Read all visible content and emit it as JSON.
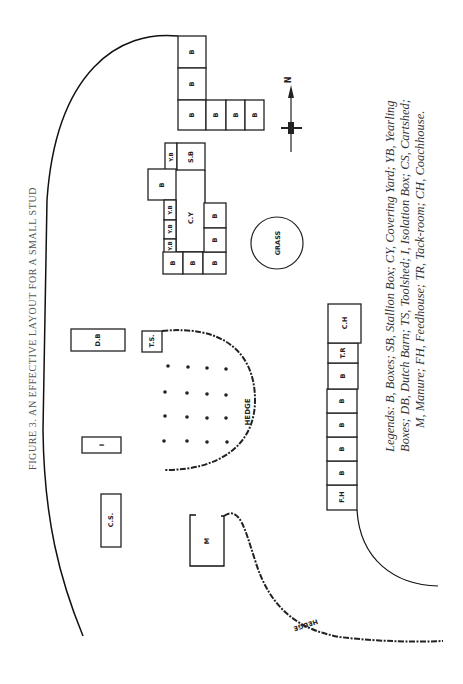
{
  "figure": {
    "title": "FIGURE 3. AN EFFECTIVE LAYOUT FOR A SMALL STUD",
    "legend_line1": "Legends: B, Boxes; SB, Stallion Box; CY, Covering Yard; YB, Yearling",
    "legend_line2": "Boxes; DB, Dutch Barn; TS, Toolshed; I, Isolation Box; CS, Cartshed;",
    "legend_line3": "M, Manure; FH, Feedhouse; TR, Tack-room; CH, Coachhouse."
  },
  "compass": {
    "label": "N"
  },
  "labels": {
    "box": "B",
    "stallion_box": "S.B",
    "yearling_box": "Y.B",
    "covering_yard": "C.Y",
    "grass": "GRASS",
    "dutch_barn": "D.B",
    "toolshed": "T.S.",
    "isolation": "I",
    "cartshed": "C.S.",
    "manure": "M",
    "feedhouse": "F.H",
    "tack_room": "T.R",
    "coachhouse": "C.H",
    "hedge": "HEDGE"
  },
  "legend": [
    {
      "code": "B",
      "meaning": "Boxes"
    },
    {
      "code": "SB",
      "meaning": "Stallion Box"
    },
    {
      "code": "CY",
      "meaning": "Covering Yard"
    },
    {
      "code": "YB",
      "meaning": "Yearling Boxes"
    },
    {
      "code": "DB",
      "meaning": "Dutch Barn"
    },
    {
      "code": "TS",
      "meaning": "Toolshed"
    },
    {
      "code": "I",
      "meaning": "Isolation Box"
    },
    {
      "code": "CS",
      "meaning": "Cartshed"
    },
    {
      "code": "M",
      "meaning": "Manure"
    },
    {
      "code": "FH",
      "meaning": "Feedhouse"
    },
    {
      "code": "TR",
      "meaning": "Tack-room"
    },
    {
      "code": "CH",
      "meaning": "Coachhouse"
    }
  ]
}
